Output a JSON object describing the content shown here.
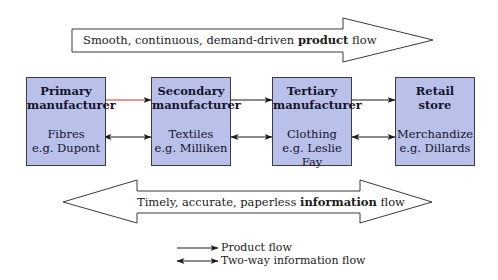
{
  "colors": {
    "box_fill": "#b9c0ea",
    "box_border": "#3a3a48",
    "line": "#1b1b1b",
    "highlight_line": "#d0302a"
  },
  "top_arrow": {
    "text_before": "Smooth, continuous, demand-driven ",
    "text_bold": "product",
    "text_after": " flow",
    "direction": "right"
  },
  "boxes": [
    {
      "title_line1": "Primary",
      "title_line2": "manufacturer",
      "sub_line1": "Fibres",
      "sub_line2": "e.g. Dupont"
    },
    {
      "title_line1": "Secondary",
      "title_line2": "manufacturer",
      "sub_line1": "Textiles",
      "sub_line2": "e.g. Milliken"
    },
    {
      "title_line1": "Tertiary",
      "title_line2": "manufacturer",
      "sub_line1": "Clothing",
      "sub_line2": "e.g. Leslie Fay"
    },
    {
      "title_line1": "Retail",
      "title_line2": "store",
      "sub_line1": "Merchandize",
      "sub_line2": "e.g. Dillards"
    }
  ],
  "connectors": [
    {
      "from": "Primary manufacturer",
      "to": "Secondary manufacturer",
      "product_flow": "one-way",
      "information_flow": "two-way"
    },
    {
      "from": "Secondary manufacturer",
      "to": "Tertiary manufacturer",
      "product_flow": "one-way",
      "information_flow": "two-way"
    },
    {
      "from": "Tertiary manufacturer",
      "to": "Retail store",
      "product_flow": "one-way",
      "information_flow": "two-way"
    }
  ],
  "bottom_arrow": {
    "text_before": "Timely, accurate, paperless ",
    "text_bold": "information",
    "text_after": " flow",
    "direction": "both"
  },
  "legend": [
    {
      "symbol": "one-way-arrow",
      "label": "Product flow"
    },
    {
      "symbol": "two-way-arrow",
      "label": "Two-way information flow"
    }
  ]
}
